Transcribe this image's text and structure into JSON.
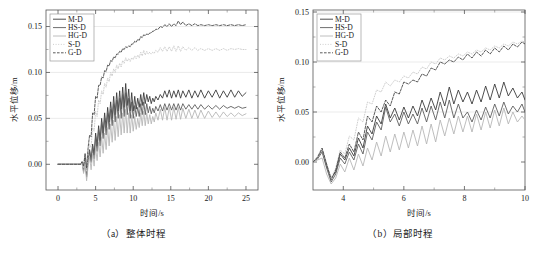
{
  "figure": {
    "panels": [
      {
        "id": "panel-a",
        "caption": "（a）整体时程",
        "xlabel": "时间/s",
        "ylabel": "水平位移/m",
        "xticks": [
          0,
          5,
          10,
          15,
          20,
          25
        ],
        "xtick_labels": [
          "0",
          "5",
          "10",
          "15",
          "20",
          "25"
        ],
        "yticks": [
          0.0,
          0.05,
          0.1,
          0.15
        ],
        "ytick_labels": [
          "0.00",
          "0.05",
          "0.10",
          "0.15"
        ],
        "xlim": [
          -1.6,
          26.6
        ],
        "ylim": [
          -0.028,
          0.168
        ],
        "gridlines_y": [
          0.05,
          0.1,
          0.15
        ]
      },
      {
        "id": "panel-b",
        "caption": "（b）局部时程",
        "xlabel": "时间/s",
        "ylabel": "水平位移/m",
        "xticks": [
          4,
          6,
          8,
          10
        ],
        "xtick_labels": [
          "4",
          "6",
          "8",
          "10"
        ],
        "yticks": [
          0.0,
          0.05,
          0.1,
          0.15
        ],
        "ytick_labels": [
          "0.00",
          "0.05",
          "0.10",
          "0.15"
        ],
        "xlim": [
          3.0,
          10.0
        ],
        "ylim": [
          -0.028,
          0.152
        ],
        "gridlines_y": [
          0.05,
          0.1,
          0.15
        ]
      }
    ],
    "legend": {
      "entries": [
        {
          "label": "M-D",
          "color": "#3b3b3b",
          "dash": "none",
          "width": 0.9
        },
        {
          "label": "HS-D",
          "color": "#5e5e5e",
          "dash": "none",
          "width": 0.9
        },
        {
          "label": "HG-D",
          "color": "#b7b7b7",
          "dash": "none",
          "width": 0.9
        },
        {
          "label": "S-D",
          "color": "#c9c9c9",
          "dash": "1,1.6",
          "width": 0.9
        },
        {
          "label": "G-D",
          "color": "#4a4a4a",
          "dash": "2.6,1.4",
          "width": 0.9
        }
      ]
    }
  },
  "chart_data": [
    {
      "type": "line",
      "panel": "a",
      "title": "（a）整体时程",
      "xlabel": "时间/s",
      "ylabel": "水平位移/m",
      "xlim": [
        -1.6,
        26.6
      ],
      "ylim": [
        -0.028,
        0.168
      ],
      "grid": "horizontal",
      "legend_position": "top-left",
      "x": [
        0,
        0.5,
        1,
        1.5,
        2,
        2.5,
        3,
        3.2,
        3.4,
        3.6,
        3.8,
        4.0,
        4.2,
        4.4,
        4.6,
        4.8,
        5.0,
        5.2,
        5.4,
        5.6,
        5.8,
        6.0,
        6.2,
        6.4,
        6.6,
        6.8,
        7.0,
        7.2,
        7.4,
        7.6,
        7.8,
        8.0,
        8.2,
        8.4,
        8.6,
        8.8,
        9.0,
        9.2,
        9.4,
        9.6,
        9.8,
        10.0,
        10.2,
        10.4,
        10.6,
        10.8,
        11.0,
        11.2,
        11.4,
        11.6,
        11.8,
        12.0,
        12.2,
        12.4,
        12.6,
        12.8,
        13.0,
        13.3,
        13.6,
        13.9,
        14.2,
        14.5,
        14.8,
        15.1,
        15.4,
        15.7,
        16.0,
        16.3,
        16.6,
        17.0,
        17.4,
        17.8,
        18.2,
        18.6,
        19.0,
        19.5,
        20.0,
        20.5,
        21.0,
        21.5,
        22.0,
        22.5,
        23.0,
        23.5,
        24.0,
        24.5,
        25.0
      ],
      "series": [
        {
          "name": "M-D",
          "color": "#3b3b3b",
          "values": [
            0,
            0,
            0,
            0,
            0,
            0,
            0,
            0.002,
            -0.006,
            0.008,
            -0.012,
            0.006,
            0.016,
            0.004,
            0.022,
            0.01,
            0.034,
            0.02,
            0.042,
            0.026,
            0.05,
            0.034,
            0.056,
            0.04,
            0.062,
            0.046,
            0.068,
            0.05,
            0.074,
            0.054,
            0.078,
            0.058,
            0.08,
            0.06,
            0.084,
            0.062,
            0.088,
            0.064,
            0.082,
            0.058,
            0.078,
            0.058,
            0.074,
            0.06,
            0.072,
            0.062,
            0.076,
            0.064,
            0.078,
            0.066,
            0.076,
            0.068,
            0.074,
            0.066,
            0.072,
            0.068,
            0.074,
            0.07,
            0.076,
            0.072,
            0.08,
            0.073,
            0.081,
            0.072,
            0.08,
            0.073,
            0.081,
            0.072,
            0.08,
            0.073,
            0.081,
            0.072,
            0.08,
            0.073,
            0.081,
            0.072,
            0.08,
            0.073,
            0.081,
            0.072,
            0.08,
            0.073,
            0.081,
            0.073,
            0.08,
            0.074,
            0.078
          ]
        },
        {
          "name": "HS-D",
          "color": "#5e5e5e",
          "values": [
            0,
            0,
            0,
            0,
            0,
            0,
            0,
            0.002,
            -0.008,
            0.006,
            -0.014,
            0.004,
            0.014,
            0.002,
            0.02,
            0.006,
            0.03,
            0.014,
            0.038,
            0.02,
            0.046,
            0.028,
            0.05,
            0.032,
            0.056,
            0.038,
            0.06,
            0.042,
            0.066,
            0.046,
            0.07,
            0.05,
            0.072,
            0.05,
            0.076,
            0.052,
            0.078,
            0.054,
            0.072,
            0.05,
            0.068,
            0.05,
            0.064,
            0.052,
            0.062,
            0.052,
            0.066,
            0.054,
            0.068,
            0.054,
            0.066,
            0.056,
            0.063,
            0.055,
            0.061,
            0.056,
            0.063,
            0.058,
            0.065,
            0.058,
            0.066,
            0.059,
            0.066,
            0.059,
            0.066,
            0.059,
            0.066,
            0.059,
            0.066,
            0.06,
            0.065,
            0.06,
            0.065,
            0.06,
            0.065,
            0.06,
            0.064,
            0.06,
            0.064,
            0.06,
            0.064,
            0.061,
            0.063,
            0.061,
            0.063,
            0.061,
            0.062
          ]
        },
        {
          "name": "HG-D",
          "color": "#b7b7b7",
          "values": [
            0,
            0,
            0,
            0,
            0,
            0,
            0,
            0.001,
            -0.01,
            0.002,
            -0.018,
            -0.002,
            0.008,
            -0.006,
            0.012,
            -0.002,
            0.018,
            0.004,
            0.024,
            0.008,
            0.03,
            0.012,
            0.034,
            0.016,
            0.04,
            0.02,
            0.044,
            0.024,
            0.048,
            0.026,
            0.052,
            0.03,
            0.054,
            0.032,
            0.056,
            0.034,
            0.06,
            0.034,
            0.056,
            0.034,
            0.054,
            0.036,
            0.052,
            0.038,
            0.05,
            0.04,
            0.056,
            0.042,
            0.058,
            0.042,
            0.056,
            0.044,
            0.054,
            0.044,
            0.052,
            0.046,
            0.056,
            0.048,
            0.06,
            0.048,
            0.062,
            0.048,
            0.062,
            0.048,
            0.062,
            0.049,
            0.062,
            0.049,
            0.061,
            0.05,
            0.06,
            0.05,
            0.059,
            0.05,
            0.059,
            0.05,
            0.058,
            0.051,
            0.057,
            0.051,
            0.057,
            0.052,
            0.056,
            0.052,
            0.056,
            0.053,
            0.055
          ]
        },
        {
          "name": "S-D",
          "color": "#c9c9c9",
          "dash": "1,1.6",
          "values": [
            0,
            0,
            0,
            0,
            0,
            0,
            0,
            0.002,
            -0.004,
            0.008,
            -0.008,
            0.01,
            0.022,
            0.018,
            0.04,
            0.036,
            0.058,
            0.052,
            0.07,
            0.066,
            0.08,
            0.076,
            0.088,
            0.084,
            0.094,
            0.09,
            0.1,
            0.096,
            0.104,
            0.1,
            0.108,
            0.104,
            0.11,
            0.106,
            0.113,
            0.11,
            0.116,
            0.112,
            0.115,
            0.112,
            0.116,
            0.114,
            0.118,
            0.115,
            0.119,
            0.116,
            0.122,
            0.118,
            0.124,
            0.119,
            0.123,
            0.12,
            0.122,
            0.12,
            0.122,
            0.121,
            0.124,
            0.122,
            0.127,
            0.123,
            0.128,
            0.123,
            0.128,
            0.123,
            0.129,
            0.123,
            0.129,
            0.123,
            0.128,
            0.124,
            0.127,
            0.124,
            0.127,
            0.124,
            0.126,
            0.124,
            0.126,
            0.124,
            0.126,
            0.124,
            0.126,
            0.124,
            0.126,
            0.125,
            0.126,
            0.125,
            0.125
          ]
        },
        {
          "name": "G-D",
          "color": "#4a4a4a",
          "dash": "2.6,1.4",
          "values": [
            0,
            0,
            0,
            0,
            0,
            0,
            0,
            0.003,
            -0.002,
            0.012,
            -0.004,
            0.018,
            0.032,
            0.03,
            0.056,
            0.054,
            0.074,
            0.072,
            0.086,
            0.086,
            0.095,
            0.094,
            0.102,
            0.101,
            0.108,
            0.107,
            0.113,
            0.112,
            0.117,
            0.116,
            0.12,
            0.12,
            0.123,
            0.122,
            0.126,
            0.125,
            0.128,
            0.127,
            0.129,
            0.128,
            0.131,
            0.131,
            0.134,
            0.133,
            0.136,
            0.135,
            0.139,
            0.138,
            0.141,
            0.14,
            0.142,
            0.141,
            0.143,
            0.143,
            0.145,
            0.145,
            0.147,
            0.147,
            0.15,
            0.149,
            0.152,
            0.15,
            0.153,
            0.15,
            0.153,
            0.151,
            0.156,
            0.152,
            0.155,
            0.151,
            0.153,
            0.151,
            0.153,
            0.151,
            0.152,
            0.151,
            0.152,
            0.151,
            0.152,
            0.151,
            0.152,
            0.151,
            0.152,
            0.151,
            0.152,
            0.151,
            0.152
          ]
        }
      ]
    },
    {
      "type": "line",
      "panel": "b",
      "title": "（b）局部时程",
      "xlabel": "时间/s",
      "ylabel": "水平位移/m",
      "xlim": [
        3.0,
        10.0
      ],
      "ylim": [
        -0.028,
        0.152
      ],
      "grid": "horizontal",
      "legend_position": "top-left",
      "x": [
        3.0,
        3.15,
        3.3,
        3.45,
        3.6,
        3.75,
        3.9,
        4.05,
        4.2,
        4.35,
        4.5,
        4.65,
        4.8,
        4.95,
        5.1,
        5.25,
        5.4,
        5.55,
        5.7,
        5.85,
        6.0,
        6.15,
        6.3,
        6.45,
        6.6,
        6.75,
        6.9,
        7.05,
        7.2,
        7.35,
        7.5,
        7.65,
        7.8,
        7.95,
        8.1,
        8.25,
        8.4,
        8.55,
        8.7,
        8.85,
        9.0,
        9.15,
        9.3,
        9.45,
        9.6,
        9.75,
        9.9,
        10.0
      ],
      "series": [
        {
          "name": "M-D",
          "color": "#3b3b3b",
          "values": [
            0,
            0.004,
            0.012,
            -0.004,
            -0.016,
            -0.01,
            0.008,
            0.002,
            0.014,
            0.006,
            0.024,
            0.014,
            0.036,
            0.028,
            0.046,
            0.038,
            0.058,
            0.044,
            0.054,
            0.042,
            0.055,
            0.044,
            0.056,
            0.046,
            0.062,
            0.05,
            0.064,
            0.052,
            0.07,
            0.056,
            0.075,
            0.058,
            0.072,
            0.06,
            0.07,
            0.058,
            0.072,
            0.06,
            0.076,
            0.062,
            0.078,
            0.064,
            0.08,
            0.066,
            0.074,
            0.064,
            0.07,
            0.062
          ]
        },
        {
          "name": "HS-D",
          "color": "#5e5e5e",
          "values": [
            0,
            0.003,
            0.01,
            -0.006,
            -0.02,
            -0.012,
            0.004,
            -0.002,
            0.01,
            0.002,
            0.018,
            0.008,
            0.03,
            0.022,
            0.04,
            0.032,
            0.055,
            0.04,
            0.048,
            0.036,
            0.05,
            0.038,
            0.048,
            0.038,
            0.054,
            0.04,
            0.056,
            0.042,
            0.06,
            0.044,
            0.062,
            0.044,
            0.058,
            0.044,
            0.05,
            0.04,
            0.052,
            0.042,
            0.055,
            0.044,
            0.058,
            0.046,
            0.06,
            0.048,
            0.056,
            0.05,
            0.058,
            0.05
          ]
        },
        {
          "name": "HG-D",
          "color": "#b7b7b7",
          "values": [
            0,
            0.002,
            0.004,
            -0.012,
            -0.022,
            -0.016,
            -0.002,
            -0.01,
            0.004,
            -0.008,
            0.008,
            -0.004,
            0.014,
            0.002,
            0.02,
            0.006,
            0.026,
            0.01,
            0.028,
            0.012,
            0.03,
            0.014,
            0.032,
            0.016,
            0.036,
            0.018,
            0.038,
            0.02,
            0.042,
            0.026,
            0.044,
            0.028,
            0.046,
            0.03,
            0.046,
            0.03,
            0.048,
            0.032,
            0.05,
            0.034,
            0.052,
            0.036,
            0.054,
            0.038,
            0.05,
            0.04,
            0.046,
            0.042
          ]
        },
        {
          "name": "S-D",
          "color": "#c9c9c9",
          "dash": "1,1.6",
          "values": [
            0,
            0.004,
            0.012,
            -0.002,
            -0.016,
            -0.006,
            0.012,
            0.008,
            0.026,
            0.022,
            0.044,
            0.04,
            0.06,
            0.058,
            0.072,
            0.07,
            0.08,
            0.076,
            0.082,
            0.08,
            0.086,
            0.084,
            0.09,
            0.088,
            0.095,
            0.093,
            0.1,
            0.098,
            0.104,
            0.102,
            0.106,
            0.104,
            0.108,
            0.106,
            0.11,
            0.108,
            0.112,
            0.11,
            0.114,
            0.112,
            0.116,
            0.114,
            0.118,
            0.116,
            0.12,
            0.118,
            0.121,
            0.12
          ]
        },
        {
          "name": "G-D",
          "color": "#4a4a4a",
          "dash": "2.6,1.4",
          "values": [
            0,
            0.005,
            0.014,
            -0.002,
            -0.018,
            -0.008,
            0.01,
            0.004,
            0.018,
            0.01,
            0.03,
            0.022,
            0.046,
            0.04,
            0.056,
            0.05,
            0.062,
            0.056,
            0.07,
            0.068,
            0.08,
            0.078,
            0.082,
            0.08,
            0.088,
            0.086,
            0.094,
            0.092,
            0.1,
            0.098,
            0.102,
            0.1,
            0.105,
            0.102,
            0.108,
            0.104,
            0.11,
            0.106,
            0.112,
            0.108,
            0.114,
            0.11,
            0.116,
            0.112,
            0.118,
            0.115,
            0.12,
            0.118
          ]
        }
      ]
    }
  ]
}
